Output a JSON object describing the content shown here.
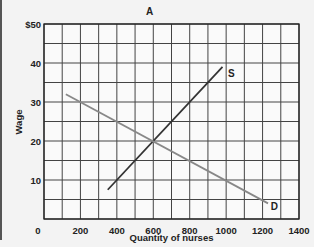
{
  "chart_data": {
    "type": "line",
    "title": "A",
    "xlabel": "Quantity of nurses",
    "ylabel": "Wage",
    "xlim": [
      0,
      1400
    ],
    "ylim": [
      0,
      50
    ],
    "x_ticks": [
      "0",
      "200",
      "400",
      "600",
      "800",
      "1000",
      "1200",
      "1400"
    ],
    "y_ticks": [
      "10",
      "20",
      "30",
      "40",
      "$50"
    ],
    "grid": true,
    "grid_x_step": 100,
    "grid_y_step": 5,
    "series": [
      {
        "name": "S",
        "label": "S",
        "color": "#333333",
        "x": [
          350,
          980
        ],
        "y": [
          7.5,
          39
        ]
      },
      {
        "name": "D",
        "label": "D",
        "color": "#888888",
        "x": [
          120,
          1230
        ],
        "y": [
          32,
          4
        ]
      }
    ],
    "equilibrium": {
      "x": 600,
      "y": 20
    }
  }
}
